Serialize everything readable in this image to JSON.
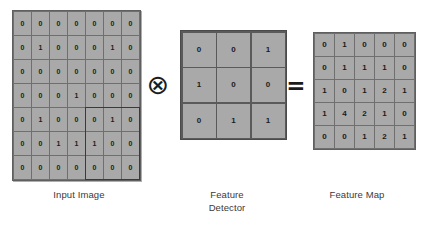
{
  "diagram": {
    "operators": {
      "convolve": "⊗",
      "equals": "="
    },
    "colors": {
      "cell_fill": "#a9a9a9",
      "grid_line": "#6f6f6f",
      "text": "#1b1b1b",
      "highlight_border": "#3a3a3a",
      "background": "#ffffff"
    },
    "panels": {
      "input": {
        "caption": "Input Image",
        "rows": 7,
        "cols": 7,
        "highlight": {
          "row_start": 4,
          "col_start": 4,
          "rows": 3,
          "cols": 3
        }
      },
      "detector": {
        "caption_line1": "Feature",
        "caption_line2": "Detector",
        "rows": 3,
        "cols": 3
      },
      "map": {
        "caption": "Feature Map",
        "rows": 5,
        "cols": 5
      }
    }
  },
  "chart_data": {
    "type": "heatmap",
    "matrices": [
      {
        "name": "Input Image",
        "shape": [
          7,
          7
        ],
        "values": [
          [
            0,
            0,
            0,
            0,
            0,
            0,
            0
          ],
          [
            0,
            1,
            0,
            0,
            0,
            1,
            0
          ],
          [
            0,
            0,
            0,
            0,
            0,
            0,
            0
          ],
          [
            0,
            0,
            0,
            1,
            0,
            0,
            0
          ],
          [
            0,
            1,
            0,
            0,
            0,
            1,
            0
          ],
          [
            0,
            0,
            1,
            1,
            1,
            0,
            0
          ],
          [
            0,
            0,
            0,
            0,
            0,
            0,
            0
          ]
        ]
      },
      {
        "name": "Feature Detector",
        "shape": [
          3,
          3
        ],
        "values": [
          [
            0,
            0,
            1
          ],
          [
            1,
            0,
            0
          ],
          [
            0,
            1,
            1
          ]
        ]
      },
      {
        "name": "Feature Map",
        "shape": [
          5,
          5
        ],
        "values": [
          [
            0,
            1,
            0,
            0,
            0
          ],
          [
            0,
            1,
            1,
            1,
            0
          ],
          [
            1,
            0,
            1,
            2,
            1
          ],
          [
            1,
            4,
            2,
            1,
            0
          ],
          [
            0,
            0,
            1,
            2,
            1
          ]
        ]
      }
    ]
  }
}
